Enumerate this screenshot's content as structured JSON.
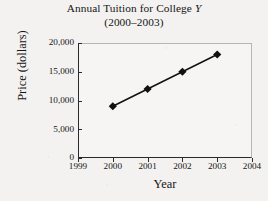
{
  "chart_data": {
    "type": "line",
    "title": "Annual Tuition for College Y",
    "title_main": "Annual Tuition for College ",
    "title_italic_token": "Y",
    "subtitle": "(2000–2003)",
    "xlabel": "Year",
    "ylabel": "Price (dollars)",
    "x": [
      2000,
      2001,
      2002,
      2003
    ],
    "values": [
      9000,
      12000,
      15000,
      18000
    ],
    "series": [
      {
        "name": "Tuition",
        "values": [
          9000,
          12000,
          15000,
          18000
        ],
        "marker": "diamond",
        "color": "#111111"
      }
    ],
    "xlim": [
      1999,
      2004
    ],
    "ylim": [
      0,
      20000
    ],
    "xticks": [
      1999,
      2000,
      2001,
      2002,
      2003,
      2004
    ],
    "xtick_labels": [
      "1999",
      "2000",
      "2001",
      "2002",
      "2003",
      "2004"
    ],
    "yticks": [
      0,
      5000,
      10000,
      15000,
      20000
    ],
    "ytick_labels": [
      "0",
      "5,000",
      "10,000",
      "15,000",
      "20,000"
    ],
    "grid": false,
    "legend": null,
    "legend_position": "none",
    "annotations": []
  },
  "figure": {
    "background_color": "#f3f2f0",
    "plot_background_color": "#f6f5f3",
    "axis_color": "#2a2a2a",
    "frame_color": "#b7b6b4",
    "text_color": "#151515"
  }
}
